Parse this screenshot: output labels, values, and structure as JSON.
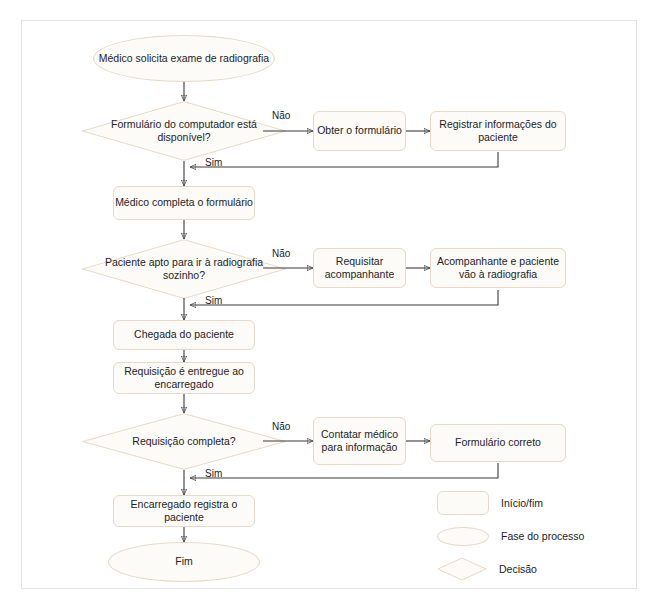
{
  "diagram": {
    "accent_border": "#e9d9c6",
    "node_fill": "#fdfbf8",
    "connector_color": "#3a3a3c",
    "frame_border": "#e3e3e5",
    "text_color": "#222226"
  },
  "nodes": {
    "start": {
      "label": "Médico solicita exame de radiografia",
      "shape": "terminator"
    },
    "d1": {
      "label": "Formulário do computador está disponível?",
      "shape": "decision"
    },
    "d1_no_box": {
      "label": "Obter o formulário",
      "shape": "process"
    },
    "d1_no_box2": {
      "label": "Registrar informações do paciente",
      "shape": "process"
    },
    "p1": {
      "label": "Médico completa o formulário",
      "shape": "process"
    },
    "d2": {
      "label": "Paciente apto para ir à radiografia sozinho?",
      "shape": "decision"
    },
    "d2_no_box": {
      "label": "Requisitar acompanhante",
      "shape": "process"
    },
    "d2_no_box2": {
      "label": "Acompanhante e paciente vão à radiografia",
      "shape": "process"
    },
    "p2": {
      "label": "Chegada do paciente",
      "shape": "process"
    },
    "p3": {
      "label": "Requisição é entregue ao encarregado",
      "shape": "process"
    },
    "d3": {
      "label": "Requisição completa?",
      "shape": "decision"
    },
    "d3_no_box": {
      "label": "Contatar médico para informação",
      "shape": "process"
    },
    "d3_no_box2": {
      "label": "Formulário correto",
      "shape": "process"
    },
    "p4": {
      "label": "Encarregado registra o paciente",
      "shape": "process"
    },
    "end": {
      "label": "Fim",
      "shape": "terminator"
    }
  },
  "edge_labels": {
    "d1_no": "Não",
    "d1_yes": "Sim",
    "d2_no": "Não",
    "d2_yes": "Sim",
    "d3_no": "Não",
    "d3_yes": "Sim"
  },
  "legend": {
    "items": [
      {
        "shape": "rect",
        "label": "Início/fim"
      },
      {
        "shape": "ellipse",
        "label": "Fase do processo"
      },
      {
        "shape": "diamond",
        "label": "Decisão"
      }
    ]
  },
  "footnote": {
    "text": ""
  }
}
